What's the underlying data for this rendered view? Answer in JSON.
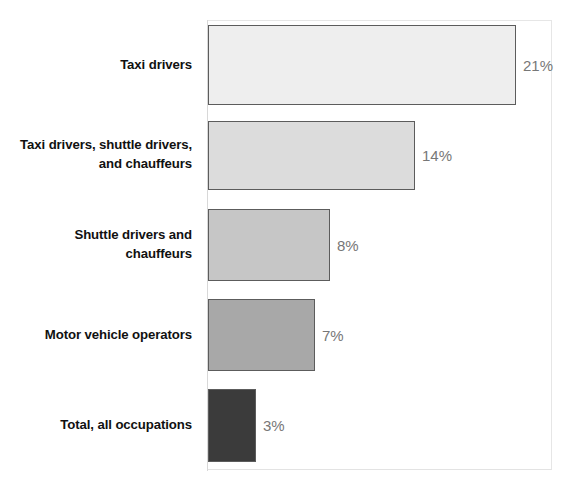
{
  "chart_data": {
    "type": "bar",
    "orientation": "horizontal",
    "title": "",
    "xlabel": "",
    "ylabel": "",
    "grid": false,
    "legend": null,
    "xlim": [
      0,
      24
    ],
    "categories": [
      "Taxi drivers",
      "Taxi drivers, shuttle drivers, and chauffeurs",
      "Shuttle drivers and chauffeurs",
      "Motor vehicle operators",
      "Total, all occupations"
    ],
    "values": [
      21,
      14,
      8,
      7,
      3
    ],
    "value_labels": [
      "21%",
      "14%",
      "8%",
      "7%",
      "3%"
    ],
    "bar_colors": [
      "#eeeeee",
      "#dcdcdc",
      "#c6c6c6",
      "#a8a8a8",
      "#3b3b3b"
    ],
    "bar_border_color": "#5c5c5c",
    "value_label_color": "#777777",
    "category_label_color": "#111111"
  },
  "bars": [
    {
      "label_line1": "Taxi drivers",
      "label_line2": "",
      "value_label": "21%",
      "value": 21,
      "color": "#eeeeee",
      "width_px": 308
    },
    {
      "label_line1": "Taxi drivers, shuttle drivers,",
      "label_line2": "and chauffeurs",
      "value_label": "14%",
      "value": 14,
      "color": "#dcdcdc",
      "width_px": 207
    },
    {
      "label_line1": "Shuttle drivers and",
      "label_line2": "chauffeurs",
      "value_label": "8%",
      "value": 8,
      "color": "#c6c6c6",
      "width_px": 122
    },
    {
      "label_line1": "Motor vehicle operators",
      "label_line2": "",
      "value_label": "7%",
      "value": 7,
      "color": "#a8a8a8",
      "width_px": 107
    },
    {
      "label_line1": "Total, all occupations",
      "label_line2": "",
      "value_label": "3%",
      "value": 3,
      "color": "#3b3b3b",
      "width_px": 48
    }
  ]
}
